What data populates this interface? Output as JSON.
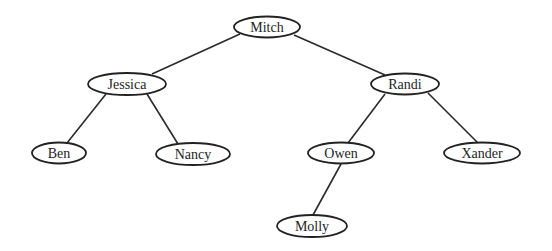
{
  "diagram": {
    "type": "binary-tree",
    "nodes": [
      {
        "id": "mitch",
        "label": "Mitch",
        "cx": 267,
        "cy": 27,
        "rx": 33,
        "ry": 10.5
      },
      {
        "id": "jessica",
        "label": "Jessica",
        "cx": 127,
        "cy": 84,
        "rx": 39,
        "ry": 11
      },
      {
        "id": "randi",
        "label": "Randi",
        "cx": 405,
        "cy": 84,
        "rx": 34,
        "ry": 10.5
      },
      {
        "id": "ben",
        "label": "Ben",
        "cx": 59,
        "cy": 153,
        "rx": 27,
        "ry": 10.5
      },
      {
        "id": "nancy",
        "label": "Nancy",
        "cx": 193,
        "cy": 154,
        "rx": 37,
        "ry": 11
      },
      {
        "id": "owen",
        "label": "Owen",
        "cx": 341,
        "cy": 153,
        "rx": 33,
        "ry": 10.5
      },
      {
        "id": "xander",
        "label": "Xander",
        "cx": 482,
        "cy": 153,
        "rx": 38,
        "ry": 10.5
      },
      {
        "id": "molly",
        "label": "Molly",
        "cx": 312,
        "cy": 226,
        "rx": 35,
        "ry": 11
      }
    ],
    "edges": [
      {
        "from": "mitch",
        "to": "jessica",
        "x1": 240,
        "y1": 34,
        "x2": 152,
        "y2": 74
      },
      {
        "from": "mitch",
        "to": "randi",
        "x1": 294,
        "y1": 35,
        "x2": 385,
        "y2": 75
      },
      {
        "from": "jessica",
        "to": "ben",
        "x1": 106,
        "y1": 94,
        "x2": 67,
        "y2": 143
      },
      {
        "from": "jessica",
        "to": "nancy",
        "x1": 147,
        "y1": 94,
        "x2": 178,
        "y2": 144
      },
      {
        "from": "randi",
        "to": "owen",
        "x1": 385,
        "y1": 94,
        "x2": 348,
        "y2": 143
      },
      {
        "from": "randi",
        "to": "xander",
        "x1": 428,
        "y1": 93,
        "x2": 478,
        "y2": 143
      },
      {
        "from": "owen",
        "to": "molly",
        "x1": 341,
        "y1": 164,
        "x2": 313,
        "y2": 215
      }
    ]
  }
}
